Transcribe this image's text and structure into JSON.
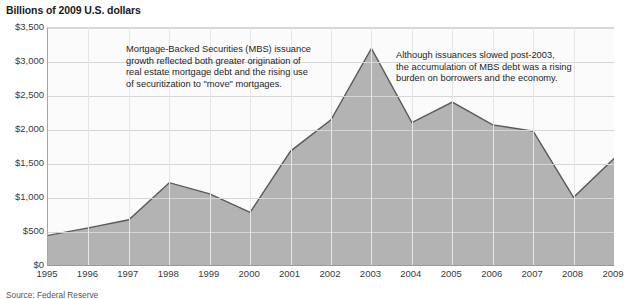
{
  "chart_data": {
    "type": "area",
    "title": "Billions of 2009 U.S. dollars",
    "xlabel": "",
    "ylabel": "Billions of 2009 U.S. dollars",
    "grid": true,
    "legend": "none",
    "xlim": [
      1995,
      2009
    ],
    "ylim": [
      0,
      3500
    ],
    "ytick_step": 500,
    "categories": [
      "1995",
      "1996",
      "1997",
      "1998",
      "1999",
      "2000",
      "2001",
      "2002",
      "2003",
      "2004",
      "2005",
      "2006",
      "2007",
      "2008",
      "2009"
    ],
    "x": [
      1995,
      1996,
      1997,
      1998,
      1999,
      2000,
      2001,
      2002,
      2003,
      2004,
      2005,
      2006,
      2007,
      2008,
      2009
    ],
    "values": [
      450,
      560,
      680,
      1225,
      1060,
      790,
      1690,
      2150,
      3200,
      2110,
      2410,
      2075,
      1985,
      1010,
      1580
    ],
    "series": [
      {
        "name": "MBS issuance",
        "values": [
          450,
          560,
          680,
          1225,
          1060,
          790,
          1690,
          2150,
          3200,
          2110,
          2410,
          2075,
          1985,
          1010,
          1580
        ]
      }
    ],
    "ytick_labels": [
      "$0",
      "$500",
      "$1,000",
      "$1,500",
      "$2,000",
      "$2,500",
      "$3,000",
      "$3,500"
    ],
    "ytick_values": [
      0,
      500,
      1000,
      1500,
      2000,
      2500,
      3000,
      3500
    ],
    "annotations": [
      {
        "id": "left",
        "text": "Mortgage-Backed Securities (MBS) issuance\ngrowth reflected both greater origination of\nreal estate mortgage debt and the rising use\nof securitization to \"move\" mortgages."
      },
      {
        "id": "right",
        "text": "Although issuances slowed post-2003,\nthe accumulation of MBS debt was a rising\nburden on borrowers and the economy."
      }
    ],
    "colors": {
      "area_fill": "#b3b3b3",
      "line_stroke": "#5a5a5a",
      "gridline": "#d6d6d6",
      "plot_background": "#fbfbfb",
      "axis": "#9a9a9a",
      "text": "#231f20"
    }
  },
  "source_note": "Source: Federal Reserve"
}
